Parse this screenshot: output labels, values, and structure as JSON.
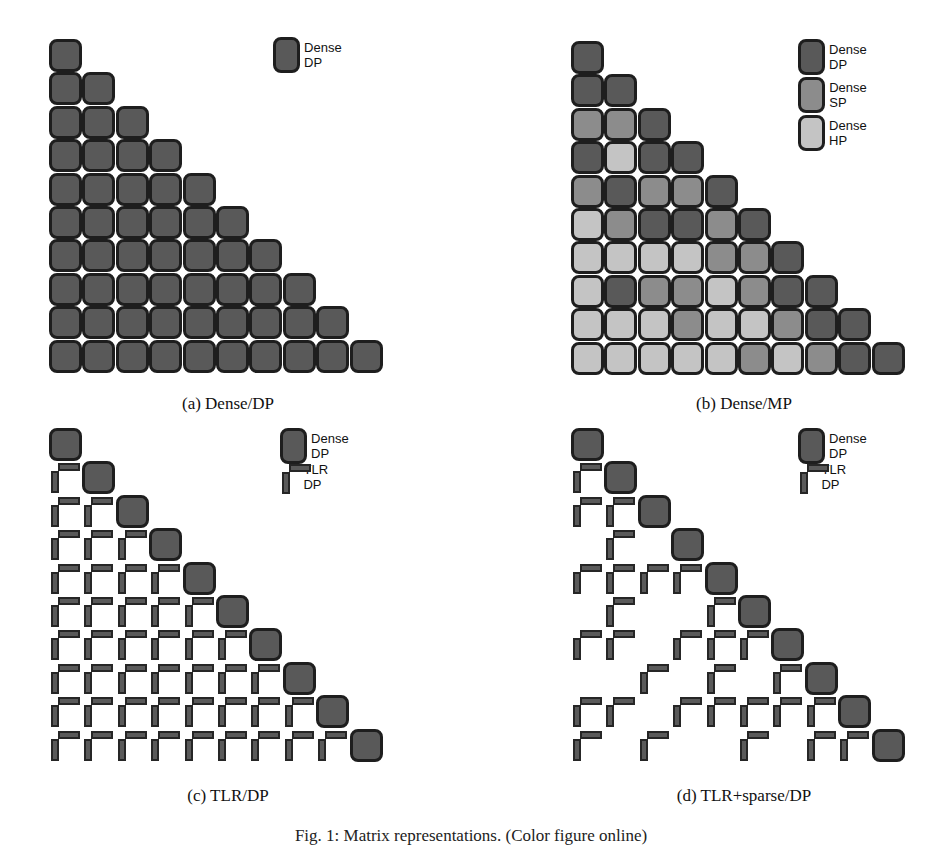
{
  "colors": {
    "dense_dp": "#595959",
    "dense_sp": "#8c8c8c",
    "dense_hp": "#c4c4c4",
    "tlr_dp": "#5a5a5a",
    "border": "#1e1e1e"
  },
  "panels": [
    {
      "id": "a",
      "caption": "(a) Dense/DP",
      "legend": [
        {
          "label": "Dense DP",
          "type": "dense",
          "precision": "D"
        }
      ],
      "kind": "dense",
      "rows": [
        "D",
        "DD",
        "DDD",
        "DDDD",
        "DDDDD",
        "DDDDDD",
        "DDDDDDD",
        "DDDDDDDD",
        "DDDDDDDDD",
        "DDDDDDDDDD"
      ]
    },
    {
      "id": "b",
      "caption": "(b) Dense/MP",
      "legend": [
        {
          "label": "Dense DP",
          "type": "dense",
          "precision": "D"
        },
        {
          "label": "Dense SP",
          "type": "dense",
          "precision": "S"
        },
        {
          "label": "Dense HP",
          "type": "dense",
          "precision": "H"
        }
      ],
      "kind": "dense",
      "rows": [
        "D",
        "DD",
        "SSD",
        "DHDD",
        "SDSSD",
        "HSDDSD",
        "HHHHSSD",
        "HDSSHSDD",
        "HHHSHHSDD",
        "HHHHHSHSDD"
      ]
    },
    {
      "id": "c",
      "caption": "(c) TLR/DP",
      "legend": [
        {
          "label": "Dense DP",
          "type": "dense",
          "precision": "D"
        },
        {
          "label": "TLR DP",
          "type": "tlr",
          "precision": "D"
        }
      ],
      "kind": "tlr",
      "rows": [
        "D",
        "TD",
        "TTD",
        "TTTD",
        "TTTTD",
        "TTTTTD",
        "TTTTTTD",
        "TTTTTTTD",
        "TTTTTTTTD",
        "TTTTTTTTTD"
      ]
    },
    {
      "id": "d",
      "caption": "(d) TLR+sparse/DP",
      "legend": [
        {
          "label": "Dense DP",
          "type": "dense",
          "precision": "D"
        },
        {
          "label": "TLR DP",
          "type": "tlr",
          "precision": "D"
        }
      ],
      "kind": "tlr",
      "rows": [
        "D",
        "TD",
        "TTD",
        ".T.D",
        "TTTTD",
        ".T..TD",
        "TT.TTTD",
        "..T.T.TD",
        "TT.TTTTTD",
        "T.T..T.TTD"
      ]
    }
  ],
  "figure_caption": "Fig. 1: Matrix representations. (Color figure online)"
}
